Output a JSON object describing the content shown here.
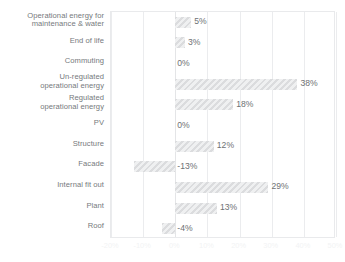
{
  "chart_data": {
    "type": "bar",
    "orientation": "horizontal",
    "title": "",
    "subtitle": "",
    "xlabel": "",
    "ylabel": "",
    "xlim": [
      -20,
      50
    ],
    "xtick_step": 10,
    "grid": true,
    "legend": null,
    "units": "%",
    "bar_color": "#e3e4e6",
    "bar_pattern": "diagonal-hatch",
    "label_color": "#76797c",
    "tick_color": "#f2f3f4",
    "gridline_color": "#ebecee",
    "tick_labels": [
      "-20%",
      "-10%",
      "0%",
      "10%",
      "20%",
      "30%",
      "40%",
      "50%"
    ],
    "tick_values": [
      -20,
      -10,
      0,
      10,
      20,
      30,
      40,
      50
    ],
    "categories": [
      "Operational energy for maintenance & water",
      "End of life",
      "Commuting",
      "Un-regulated operational energy",
      "Regulated operational energy",
      "PV",
      "Structure",
      "Facade",
      "Internal fit out",
      "Plant",
      "Roof"
    ],
    "values": [
      5,
      3,
      0,
      38,
      18,
      0,
      12,
      -13,
      29,
      13,
      -4
    ],
    "data_labels": [
      "5%",
      "3%",
      "0%",
      "38%",
      "18%",
      "0%",
      "12%",
      "-13%",
      "29%",
      "13%",
      "-4%"
    ],
    "rows": [
      {
        "label_lines": [
          "Operational energy for",
          "maintenance & water"
        ],
        "value": 5,
        "data_label": "5%"
      },
      {
        "label_lines": [
          "End of life"
        ],
        "value": 3,
        "data_label": "3%"
      },
      {
        "label_lines": [
          "Commuting"
        ],
        "value": 0,
        "data_label": "0%"
      },
      {
        "label_lines": [
          "Un-regulated",
          "operational energy"
        ],
        "value": 38,
        "data_label": "38%"
      },
      {
        "label_lines": [
          "Regulated",
          "operational energy"
        ],
        "value": 18,
        "data_label": "18%"
      },
      {
        "label_lines": [
          "PV"
        ],
        "value": 0,
        "data_label": "0%"
      },
      {
        "label_lines": [
          "Structure"
        ],
        "value": 12,
        "data_label": "12%"
      },
      {
        "label_lines": [
          "Facade"
        ],
        "value": -13,
        "data_label": "-13%"
      },
      {
        "label_lines": [
          "Internal fit out"
        ],
        "value": 29,
        "data_label": "29%"
      },
      {
        "label_lines": [
          "Plant"
        ],
        "value": 13,
        "data_label": "13%"
      },
      {
        "label_lines": [
          "Roof"
        ],
        "value": -4,
        "data_label": "-4%"
      }
    ]
  }
}
